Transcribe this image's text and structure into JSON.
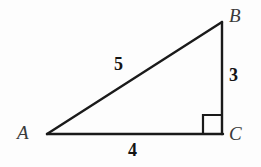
{
  "figure": {
    "background_color": "#fdfdfd",
    "stroke_color": "#1a1a1a",
    "vertices": [
      {
        "name": "A",
        "label": "A",
        "x": 47,
        "y": 134
      },
      {
        "name": "B",
        "label": "B",
        "x": 222,
        "y": 22
      },
      {
        "name": "C",
        "label": "C",
        "x": 222,
        "y": 134
      }
    ],
    "sides": [
      {
        "name": "hypotenuse-AB",
        "label": "5",
        "from": "A",
        "to": "B"
      },
      {
        "name": "leg-BC",
        "label": "3",
        "from": "B",
        "to": "C"
      },
      {
        "name": "leg-AC",
        "label": "4",
        "from": "A",
        "to": "C"
      }
    ],
    "right_angle": {
      "at_vertex": "C",
      "marker": "square",
      "size": 19
    }
  }
}
